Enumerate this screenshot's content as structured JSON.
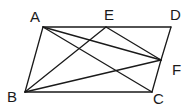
{
  "figure": {
    "type": "geometry-parallelogram",
    "colors": {
      "stroke": "#1a1a1a",
      "background": "#ffffff"
    }
  },
  "points": {
    "A": {
      "label": "A",
      "x": 43,
      "y": 27,
      "lx": 30,
      "ly": 22
    },
    "E": {
      "label": "E",
      "x": 106,
      "y": 27,
      "lx": 104,
      "ly": 20
    },
    "D": {
      "label": "D",
      "x": 171,
      "y": 27,
      "lx": 170,
      "ly": 20
    },
    "F": {
      "label": "F",
      "x": 161,
      "y": 60,
      "lx": 172,
      "ly": 75
    },
    "B": {
      "label": "B",
      "x": 25,
      "y": 92,
      "lx": 7,
      "ly": 102
    },
    "C": {
      "label": "C",
      "x": 152,
      "y": 92,
      "lx": 153,
      "ly": 104
    }
  },
  "segments": [
    [
      "A",
      "D"
    ],
    [
      "D",
      "F"
    ],
    [
      "F",
      "C"
    ],
    [
      "C",
      "B"
    ],
    [
      "B",
      "A"
    ],
    [
      "A",
      "C"
    ],
    [
      "A",
      "F"
    ],
    [
      "B",
      "E"
    ],
    [
      "B",
      "F"
    ],
    [
      "E",
      "F"
    ]
  ]
}
